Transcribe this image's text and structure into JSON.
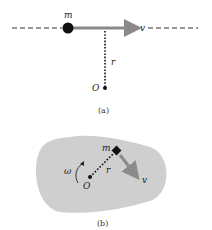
{
  "panel_a": {
    "caption": "(a)",
    "mass_label": "m",
    "velocity_label": "v",
    "radius_label": "r",
    "origin_label": "O"
  },
  "panel_b": {
    "caption": "(b)",
    "mass_label": "m",
    "velocity_label": "v",
    "radius_label": "r",
    "origin_label": "O",
    "angular_velocity_label": "ω"
  },
  "colors": {
    "arrow": "#8a8a8a",
    "body_fill": "#cfcfcf",
    "ink": "#111111"
  }
}
